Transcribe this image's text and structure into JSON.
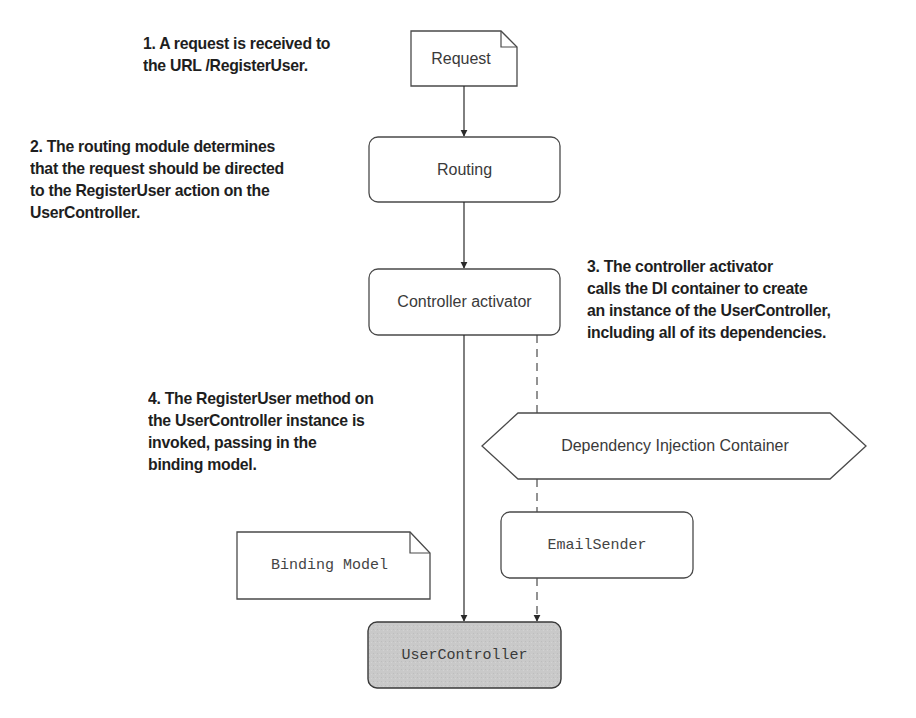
{
  "diagram": {
    "nodes": {
      "request": {
        "label": "Request",
        "shape": "document"
      },
      "routing": {
        "label": "Routing",
        "shape": "rounded-rect"
      },
      "controller_activator": {
        "label": "Controller activator",
        "shape": "rounded-rect"
      },
      "di_container": {
        "label": "Dependency Injection Container",
        "shape": "hexagon"
      },
      "email_sender": {
        "label": "EmailSender",
        "shape": "rounded-rect"
      },
      "binding_model": {
        "label": "Binding Model",
        "shape": "document"
      },
      "user_controller": {
        "label": "UserController",
        "shape": "rounded-rect",
        "fill": "#c9c9c9"
      }
    },
    "notes": {
      "step1": [
        "1. A request is received to",
        "the URL /RegisterUser."
      ],
      "step2": [
        "2. The routing module determines",
        "that the request should be directed",
        "to the RegisterUser action on the",
        "UserController."
      ],
      "step3": [
        "3. The controller activator",
        "calls the DI container to create",
        "an instance of the UserController,",
        "including all of its dependencies."
      ],
      "step4": [
        "4. The RegisterUser method on",
        "the UserController instance is",
        "invoked, passing in the",
        "binding model."
      ]
    },
    "edges": [
      {
        "from": "Request",
        "to": "Routing",
        "style": "solid"
      },
      {
        "from": "Routing",
        "to": "Controller activator",
        "style": "solid"
      },
      {
        "from": "Controller activator",
        "to": "UserController",
        "style": "solid"
      },
      {
        "from": "Controller activator",
        "to": "UserController",
        "style": "dashed",
        "via": [
          "Dependency Injection Container",
          "EmailSender"
        ]
      }
    ],
    "colors": {
      "stroke": "#4a4a4a",
      "text": "#1e1e1e",
      "user_controller_fill": "#c9c9c9"
    }
  }
}
